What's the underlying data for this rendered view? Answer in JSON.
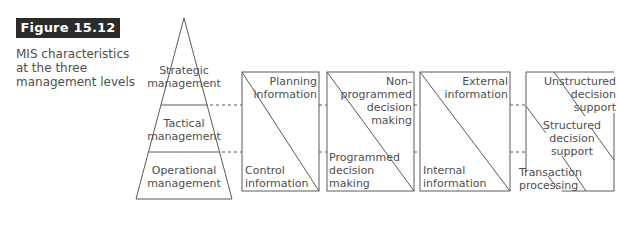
{
  "figure": {
    "label": "Figure 15.12",
    "caption_lines": [
      "MIS characteristics",
      "at the three",
      "management levels"
    ]
  },
  "pyramid": {
    "levels": [
      {
        "lines": [
          "Strategic",
          "management"
        ]
      },
      {
        "lines": [
          "Tactical",
          "management"
        ]
      },
      {
        "lines": [
          "Operational",
          "management"
        ]
      }
    ]
  },
  "boxes": [
    {
      "top_right": [
        "Planning",
        "information"
      ],
      "bottom_left": [
        "Control",
        "information"
      ]
    },
    {
      "top_right": [
        "Non-",
        "programmed",
        "decision",
        "making"
      ],
      "bottom_left": [
        "Programmed",
        "decision",
        "making"
      ]
    },
    {
      "top_right": [
        "External",
        "information"
      ],
      "bottom_left": [
        "Internal",
        "information"
      ]
    },
    {
      "top_right": [
        "Unstructured",
        "decision",
        "support"
      ],
      "middle": [
        "Structured",
        "decision",
        "support"
      ],
      "bottom_left": [
        "Transaction",
        "processing"
      ]
    }
  ],
  "colors": {
    "line": "#5a5a5a",
    "text": "#4e4e4e",
    "label_bg": "#2b2b2b",
    "label_text": "#ffffff"
  }
}
